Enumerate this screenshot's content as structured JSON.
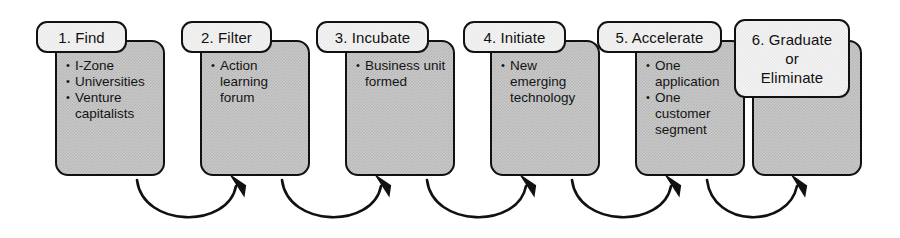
{
  "diagram": {
    "type": "process-flow",
    "colors": {
      "outline": "#111111",
      "body_fill": "#c9c9c9",
      "label_fill": "#f3f3f3",
      "text": "#111111"
    },
    "stages": [
      {
        "id": "find",
        "label": "1. Find",
        "label_lines": [
          "1. Find"
        ],
        "bullets": [
          "I-Zone",
          "Universities",
          "Venture capitalists"
        ],
        "x": 55,
        "label_x": 36,
        "label_y": 21,
        "label_w": 91,
        "label_h": 32
      },
      {
        "id": "filter",
        "label": "2. Filter",
        "label_lines": [
          "2. Filter"
        ],
        "bullets": [
          "Action learning forum"
        ],
        "x": 200,
        "label_x": 181,
        "label_y": 21,
        "label_w": 91,
        "label_h": 32
      },
      {
        "id": "incubate",
        "label": "3. Incubate",
        "label_lines": [
          "3. Incubate"
        ],
        "bullets": [
          "Business unit formed"
        ],
        "x": 345,
        "label_x": 316,
        "label_y": 21,
        "label_w": 113,
        "label_h": 32
      },
      {
        "id": "initiate",
        "label": "4. Initiate",
        "label_lines": [
          "4. Initiate"
        ],
        "bullets": [
          "New emerging technology"
        ],
        "x": 490,
        "label_x": 463,
        "label_y": 21,
        "label_w": 103,
        "label_h": 32
      },
      {
        "id": "accelerate",
        "label": "5. Accelerate",
        "label_lines": [
          "5. Accelerate"
        ],
        "bullets": [
          "One application",
          "One customer segment"
        ],
        "x": 635,
        "label_x": 597,
        "label_y": 21,
        "label_w": 125,
        "label_h": 32
      },
      {
        "id": "graduate-or-eliminate",
        "label": "6. Graduate or Eliminate",
        "label_lines": [
          "6. Graduate",
          "or",
          "Eliminate"
        ],
        "bullets": [],
        "x": 752,
        "label_x": 734,
        "label_y": 19,
        "label_w": 116,
        "label_h": 79
      }
    ],
    "connectors": [
      {
        "id": "arrow-find-to-filter",
        "from": "find",
        "to": "filter",
        "path": "M 137 180 C 143 228, 228 229, 236 186"
      },
      {
        "id": "arrow-filter-to-incubate",
        "from": "filter",
        "to": "incubate",
        "path": "M 282 180 C 288 228, 373 229, 381 186"
      },
      {
        "id": "arrow-incubate-to-initiate",
        "from": "incubate",
        "to": "initiate",
        "path": "M 427 180 C 433 228, 518 229, 526 186"
      },
      {
        "id": "arrow-initiate-to-accelerate",
        "from": "initiate",
        "to": "accelerate",
        "path": "M 572 180 C 578 228, 663 229, 671 186"
      },
      {
        "id": "arrow-accelerate-to-graduate",
        "from": "accelerate",
        "to": "graduate-or-eliminate",
        "path": "M 707 180 C 713 228, 788 229, 797 186"
      }
    ]
  }
}
